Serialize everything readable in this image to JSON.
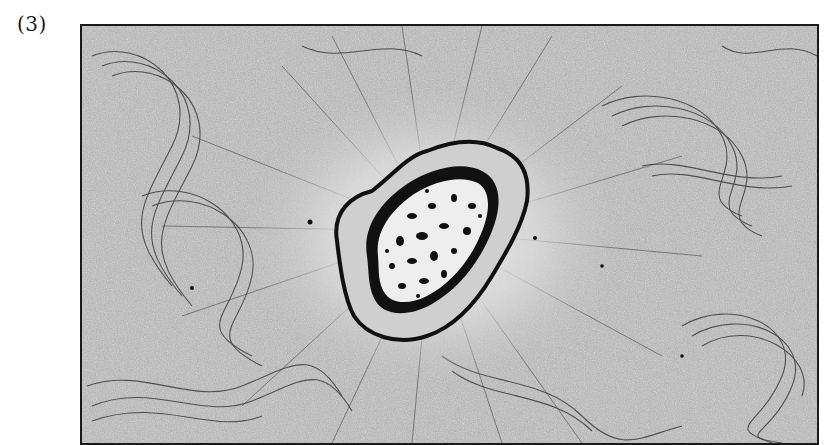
{
  "figure": {
    "label": "(3)",
    "colors": {
      "background": "#a8a8a8",
      "halo": "#e2e2e2",
      "membrane": "#111111",
      "interior": "#eeeeee",
      "frame": "#1a1a1a"
    }
  }
}
